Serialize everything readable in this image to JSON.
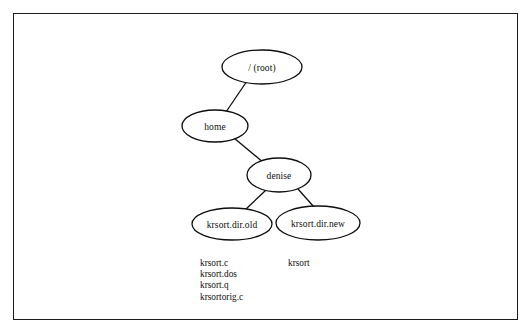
{
  "figure": {
    "type": "directory-tree-diagram",
    "border_color": "#1c1c1c",
    "background_color": "#ffffff",
    "stroke_color": "#0d0d0d"
  },
  "nodes": [
    {
      "id": "root",
      "label": "/ (root)",
      "cx": 262,
      "cy": 67,
      "rx": 40,
      "ry": 17
    },
    {
      "id": "home",
      "label": "home",
      "cx": 215,
      "cy": 126,
      "rx": 33,
      "ry": 16
    },
    {
      "id": "denise",
      "label": "denise",
      "cx": 279,
      "cy": 175,
      "rx": 32,
      "ry": 17
    },
    {
      "id": "krsort_dir_old",
      "label": "krsort.dir.old",
      "cx": 232,
      "cy": 224,
      "rx": 40,
      "ry": 16
    },
    {
      "id": "krsort_dir_new",
      "label": "krsort.dir.new",
      "cx": 318,
      "cy": 223,
      "rx": 42,
      "ry": 17
    }
  ],
  "edges": [
    {
      "from": "root",
      "to": "home",
      "x1": 247,
      "y1": 81,
      "x2": 226,
      "y2": 112
    },
    {
      "from": "home",
      "to": "denise",
      "x1": 234,
      "y1": 138,
      "x2": 264,
      "y2": 163
    },
    {
      "from": "denise",
      "to": "krsort_dir_old",
      "x1": 266,
      "y1": 190,
      "x2": 245,
      "y2": 210
    },
    {
      "from": "denise",
      "to": "krsort_dir_new",
      "x1": 298,
      "y1": 189,
      "x2": 314,
      "y2": 207
    }
  ],
  "file_lists": [
    {
      "id": "krsort-dir-old-files",
      "x": 200,
      "y": 258,
      "items": [
        "krsort.c",
        "krsort.dos",
        "krsort.q",
        "krsortorig.c"
      ]
    },
    {
      "id": "krsort-dir-new-files",
      "x": 288,
      "y": 258,
      "items": [
        "krsort"
      ]
    }
  ]
}
